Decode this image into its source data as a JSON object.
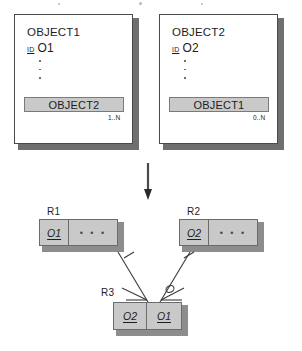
{
  "diagram": {
    "colors": {
      "page_background": "#ffffff",
      "entity_face": "#ffffff",
      "entity_border": "#4a4a4a",
      "entity_shadow": "#6f6f6f",
      "attribute_fill": "#c9c9c9",
      "attribute_border": "#7a7a7a",
      "table_fill": "#c9c9c9",
      "table_border": "#6b6b6b",
      "table_shadow": "#8d8d8d",
      "line": "#3a3a3a",
      "text": "#1d1d1d"
    },
    "object_boxes": [
      {
        "name": "OBJECT1",
        "id_label": "ID",
        "id_value": "O1",
        "ellipsis_dots": 3,
        "attribute": "OBJECT2",
        "cardinality": "1..N"
      },
      {
        "name": "OBJECT2",
        "id_label": "ID",
        "id_value": "O2",
        "ellipsis_dots": 3,
        "attribute": "OBJECT1",
        "cardinality": "0..N"
      }
    ],
    "transform_arrow": {
      "icon": "arrow-down-icon",
      "direction": "down"
    },
    "relations": [
      {
        "label": "R1",
        "cells": [
          {
            "text": "O1",
            "key": true
          },
          {
            "text": "• • •",
            "key": false
          }
        ]
      },
      {
        "label": "R2",
        "cells": [
          {
            "text": "O2",
            "key": true
          },
          {
            "text": "• • •",
            "key": false
          }
        ]
      },
      {
        "label": "R3",
        "cells": [
          {
            "text": "O2",
            "key": true
          },
          {
            "text": "O1",
            "key": true
          }
        ]
      }
    ],
    "connectors": [
      {
        "from": "R1",
        "to": "R3",
        "near_end_symbol": "crows-foot",
        "far_end_symbol": "one-tick",
        "optional": false
      },
      {
        "from": "R2",
        "to": "R3",
        "near_end_symbol": "crows-foot-optional",
        "far_end_symbol": "one-tick",
        "optional": true
      }
    ]
  }
}
